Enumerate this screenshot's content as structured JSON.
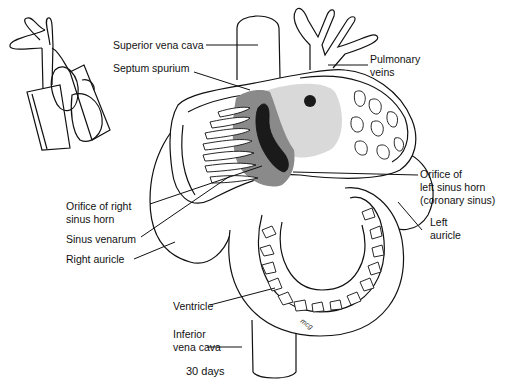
{
  "figure": {
    "caption": "30 days",
    "colors": {
      "line": "#111111",
      "background": "#ffffff",
      "septum_shade_dark": "#8a8a8a",
      "sinus_shade_light": "#d9d9d9",
      "orifice_fill": "#1a1a1a"
    }
  },
  "labels": {
    "superior_vena_cava": "Superior vena cava",
    "septum_spurium": "Septum spurium",
    "pulmonary_veins_1": "Pulmonary",
    "pulmonary_veins_2": "veins",
    "orifice_left_1": "Orifice of",
    "orifice_left_2": "left sinus horn",
    "orifice_left_3": "(coronary sinus)",
    "left_auricle_1": "Left",
    "left_auricle_2": "auricle",
    "orifice_right_1": "Orifice of right",
    "orifice_right_2": "sinus horn",
    "sinus_venarum": "Sinus venarum",
    "right_auricle": "Right auricle",
    "ventricle": "Ventricle",
    "inferior_vena_cava_1": "Inferior",
    "inferior_vena_cava_2": "vena cava"
  },
  "icons": {
    "inset": "heart-orientation-inset-icon"
  }
}
